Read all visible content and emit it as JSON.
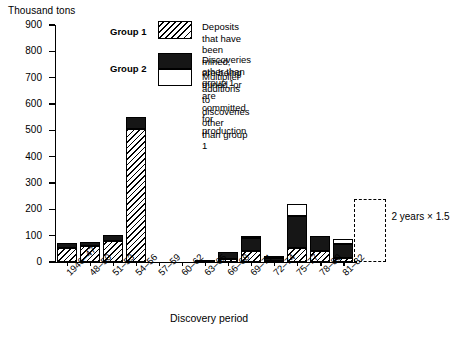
{
  "chart_data": {
    "type": "bar",
    "title": "",
    "subtitle": "",
    "ylabel": "Thousand tons",
    "xlabel": "Discovery period",
    "ylim": [
      0,
      900
    ],
    "ytick_step": 100,
    "yticks": [
      "0",
      "100",
      "200",
      "300",
      "400",
      "500",
      "600",
      "700",
      "800",
      "900"
    ],
    "grid": false,
    "stacked": true,
    "legend_position": "top-right-inside",
    "categories": [
      "1946–47",
      "48–50",
      "51–53",
      "54–56",
      "57–59",
      "60–62",
      "63–65",
      "66–68",
      "69–71",
      "72–74",
      "75–77",
      "78–80",
      "81–82"
    ],
    "series": [
      {
        "name": "Deposits that have been mined, are being mined, or are committed for production",
        "group": "Group 1",
        "fill": "hatched",
        "values": [
          55,
          60,
          80,
          505,
          0,
          0,
          0,
          10,
          42,
          5,
          55,
          42,
          15
        ]
      },
      {
        "name": "Discoveries other than group 1",
        "group": "Group 2",
        "fill": "black",
        "values": [
          17,
          15,
          22,
          45,
          0,
          0,
          8,
          28,
          48,
          10,
          120,
          58,
          55
        ]
      },
      {
        "name": "Multiplier additions to discoveries other than group 1",
        "group": "Group 2",
        "fill": "white",
        "values": [
          0,
          0,
          0,
          0,
          0,
          0,
          0,
          0,
          10,
          5,
          45,
          0,
          18
        ]
      }
    ],
    "totals": [
      72,
      75,
      102,
      550,
      0,
      0,
      8,
      38,
      100,
      20,
      220,
      100,
      88
    ],
    "annotations": [
      {
        "text": "2 years  ×  1.5",
        "kind": "dashed-projection-box",
        "applies_to": "81–82"
      }
    ]
  },
  "axes": {
    "y_title": "Thousand tons",
    "x_title": "Discovery period"
  },
  "legend": {
    "group1_label": "Group 1",
    "group2_label": "Group 2",
    "entries": [
      {
        "key": "group1",
        "swatch": "hatched-swatch",
        "text": "Deposits that have been mined, are being\nmined, or are committed for production"
      },
      {
        "key": "group2_black",
        "swatch": "black-swatch",
        "text": "Discoveries other than group 1"
      },
      {
        "key": "group2_white",
        "swatch": "white-swatch",
        "text": "Multiplier additions to discoveries other\nthan group 1"
      }
    ]
  },
  "annotation": {
    "projection_text": "2 years  ×  1.5"
  },
  "colors": {
    "ink": "#000000",
    "black_fill": "#161616",
    "white_fill": "#ffffff",
    "background": "#ffffff"
  }
}
